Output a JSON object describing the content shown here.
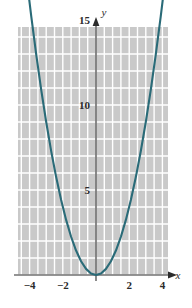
{
  "chart_data": {
    "type": "line",
    "title": "",
    "xlabel": "x",
    "ylabel": "y",
    "function": "y = x^2",
    "xlim": [
      -4.6,
      4.6
    ],
    "ylim": [
      -0.6,
      17.2
    ],
    "grid": true,
    "legend_position": "none",
    "curve_color": "#2a6b78",
    "plot_background": "#c9c9c9",
    "gridline_color": "#ffffff",
    "axis_color": "#2b2b2b",
    "x_ticks": [
      {
        "value": -4,
        "label": "−4"
      },
      {
        "value": -2,
        "label": "−2"
      },
      {
        "value": 2,
        "label": "2"
      },
      {
        "value": 4,
        "label": "4"
      }
    ],
    "y_ticks": [
      {
        "value": 5,
        "label": "5"
      },
      {
        "value": 10,
        "label": "10"
      },
      {
        "value": 15,
        "label": "15"
      }
    ],
    "x_gridlines": [
      -4.5,
      -4,
      -3.5,
      -3,
      -2.5,
      -2,
      -1.5,
      -1,
      -0.5,
      0,
      0.5,
      1,
      1.5,
      2,
      2.5,
      3,
      3.5,
      4,
      4.5
    ],
    "y_gridlines": [
      0,
      1,
      2,
      3,
      4,
      5,
      6,
      7,
      8,
      9,
      10,
      11,
      12,
      13,
      14,
      15,
      16,
      17
    ],
    "series": [
      {
        "name": "y = x^2",
        "x": [
          -4.14,
          -3.9,
          -3.6,
          -3.3,
          -3.0,
          -2.7,
          -2.4,
          -2.1,
          -1.8,
          -1.5,
          -1.2,
          -0.9,
          -0.6,
          -0.3,
          0,
          0.3,
          0.6,
          0.9,
          1.2,
          1.5,
          1.8,
          2.1,
          2.4,
          2.7,
          3.0,
          3.3,
          3.6,
          3.9,
          4.14
        ],
        "y": [
          17.14,
          15.21,
          12.96,
          10.89,
          9.0,
          7.29,
          5.76,
          4.41,
          3.24,
          2.25,
          1.44,
          0.81,
          0.36,
          0.09,
          0,
          0.09,
          0.36,
          0.81,
          1.44,
          2.25,
          3.24,
          4.41,
          5.76,
          7.29,
          9.0,
          10.89,
          12.96,
          15.21,
          17.14
        ],
        "arrow_start": true,
        "arrow_end": true
      }
    ],
    "vertex": {
      "x": 0,
      "y": 0
    }
  }
}
